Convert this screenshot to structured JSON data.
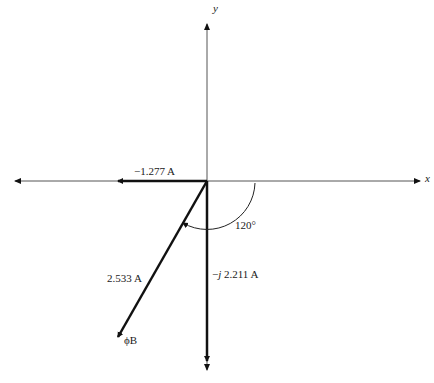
{
  "diagram": {
    "type": "phasor",
    "axes": {
      "x_label": "x",
      "y_label": "y"
    },
    "phasors": [
      {
        "name": "real-component",
        "label": "−1.277 A",
        "magnitude": 1.277,
        "angle_deg": 180
      },
      {
        "name": "imag-component",
        "label_prefix": "−",
        "label_j": "j",
        "label_value": " 2.211 A",
        "magnitude": 2.211,
        "angle_deg": -90
      },
      {
        "name": "phase-b",
        "label": "2.533 A",
        "tip_label": "ϕB",
        "magnitude": 2.533,
        "angle_deg": -120
      }
    ],
    "angle_annotation": {
      "label": "120°",
      "value_deg": 120
    }
  }
}
